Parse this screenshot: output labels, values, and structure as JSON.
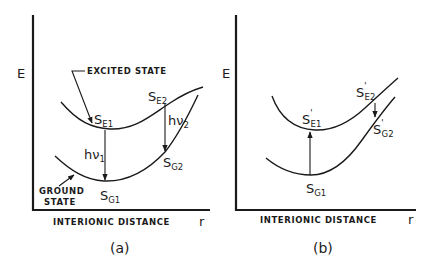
{
  "figure": {
    "panel_a": {
      "caption": "(a)",
      "y_axis_label": "E",
      "x_axis_label": "INTERIONIC DISTANCE",
      "x_axis_symbol": "r",
      "excited_state_label": "EXCITED STATE",
      "ground_state_label_line1": "GROUND",
      "ground_state_label_line2": "STATE",
      "points": {
        "se1": {
          "main": "S",
          "sub": "E1"
        },
        "se2": {
          "main": "S",
          "sub": "E2"
        },
        "sg1": {
          "main": "S",
          "sub": "G1"
        },
        "sg2": {
          "main": "S",
          "sub": "G2"
        }
      },
      "transitions": {
        "hv1": {
          "main": "hν",
          "sub": "1"
        },
        "hv2": {
          "main": "hν",
          "sub": "2"
        }
      }
    },
    "panel_b": {
      "caption": "(b)",
      "y_axis_label": "E",
      "x_axis_label": "INTERIONIC DISTANCE",
      "x_axis_symbol": "r",
      "points": {
        "se1p": {
          "main": "S",
          "prime": "'",
          "sub": "E1"
        },
        "se2p": {
          "main": "S",
          "prime": "'",
          "sub": "E2"
        },
        "sg1": {
          "main": "S",
          "sub": "G1"
        },
        "sg2p": {
          "main": "S",
          "prime": "'",
          "sub": "G2"
        }
      }
    }
  },
  "colors": {
    "ink": "#1a1a1a",
    "background": "#ffffff"
  }
}
